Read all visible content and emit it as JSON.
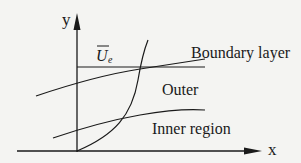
{
  "diagram": {
    "axes": {
      "x_label": "x",
      "y_label": "y"
    },
    "labels": {
      "velocity": "U",
      "velocity_subscript": "e",
      "boundary_layer": "Boundary layer",
      "outer": "Outer",
      "inner": "Inner region"
    },
    "colors": {
      "line": "#1a1a1a",
      "background": "#f4f4f2"
    }
  }
}
